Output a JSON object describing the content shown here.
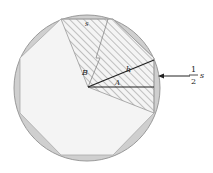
{
  "diagram": {
    "type": "octagon-inscribed-in-circle",
    "labels": {
      "top_side": "s",
      "angle_B": "B",
      "apothem": "h",
      "angle_A": "A",
      "half_side_num": "1",
      "half_side_den": "2",
      "half_side_var": "s"
    },
    "colors": {
      "circle_ring": "#cfcfcf",
      "octagon_fill": "#f4f4f4",
      "hatch": "#8a8a8a",
      "lines": "#333333"
    }
  }
}
